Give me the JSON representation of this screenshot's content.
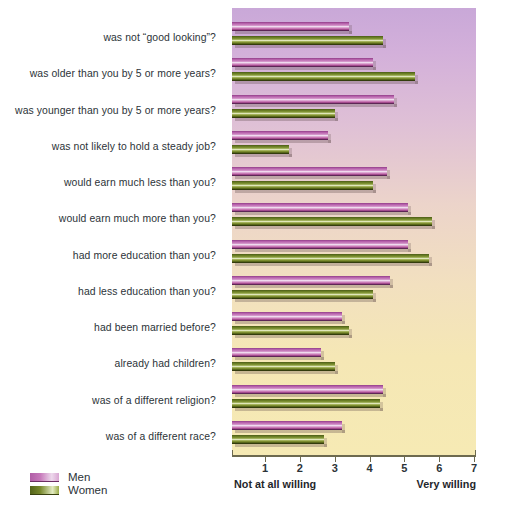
{
  "chart_data": {
    "type": "bar",
    "orientation": "horizontal",
    "title": "",
    "xlabel": "",
    "ylabel": "",
    "xlim": [
      0.4,
      7.2
    ],
    "grid": false,
    "legend_position": "bottom-left",
    "axis_anchor_low": "Not at all willing",
    "axis_anchor_high": "Very willing",
    "tick_labels": [
      "1",
      "2",
      "3",
      "4",
      "5",
      "6",
      "7"
    ],
    "tick_values": [
      1,
      2,
      3,
      4,
      5,
      6,
      7
    ],
    "categories": [
      "was not “good looking”?",
      "was older than you by 5 or more years?",
      "was younger than you by 5 or more years?",
      "was not likely to hold a steady job?",
      "would earn much less than you?",
      "would earn much more than you?",
      "had more education than you?",
      "had less education than you?",
      "had been married before?",
      "already had children?",
      "was of a different religion?",
      "was of a different race?"
    ],
    "series": [
      {
        "name": "Men",
        "color": "#bf6bb2",
        "values": [
          3.4,
          4.1,
          4.7,
          2.8,
          4.5,
          5.1,
          5.1,
          4.6,
          3.2,
          2.6,
          4.4,
          3.2
        ]
      },
      {
        "name": "Women",
        "color": "#7d9034",
        "values": [
          4.4,
          5.3,
          3.0,
          1.7,
          4.1,
          5.8,
          5.7,
          4.1,
          3.4,
          3.0,
          4.3,
          2.7
        ]
      }
    ]
  },
  "legend": {
    "items": [
      {
        "label": "Men",
        "key": "men"
      },
      {
        "label": "Women",
        "key": "women"
      }
    ]
  }
}
